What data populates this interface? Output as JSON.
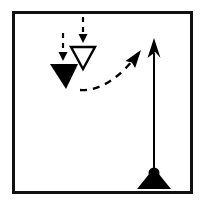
{
  "figure": {
    "title": "Force and trajectory diagram",
    "background_color": "#ffffff",
    "ink_color": "#000000"
  },
  "frame": {
    "name": "outer-border",
    "x": 12,
    "y": 11,
    "width": 181,
    "height": 183,
    "stroke_width": 3,
    "color": "#111111"
  },
  "elements": {
    "base_triangle": {
      "label": "support-base",
      "apex_x": 154,
      "apex_y": 168,
      "left_x": 137,
      "right_x": 171,
      "bottom_y": 189,
      "fill": "#000000"
    },
    "pivot_dot": {
      "label": "pivot",
      "cx": 154,
      "cy": 173,
      "r": 5.5,
      "fill": "#000000"
    },
    "vertical_arrow": {
      "label": "upward-reaction-arrow",
      "x1": 154,
      "y1": 170,
      "x2": 154,
      "y2": 38,
      "stroke_width": 2,
      "head_width": 13,
      "head_length": 20,
      "color": "#000000",
      "style": "solid"
    },
    "curved_arrow": {
      "label": "dashed-trajectory-arrow",
      "start_x": 80,
      "start_y": 90,
      "control_x": 110,
      "control_y": 92,
      "end_x": 141,
      "end_y": 50,
      "stroke_width": 2.4,
      "dash": "7 6",
      "color": "#000000",
      "style": "dashed"
    },
    "hollow_triangle": {
      "label": "open-down-triangle",
      "cx": 83,
      "top_y": 47,
      "bottom_y": 69,
      "half_width": 12,
      "fill": "none",
      "stroke": "#000000",
      "stroke_width": 2.4
    },
    "filled_triangle": {
      "label": "solid-down-triangle",
      "cx": 64,
      "top_y": 64,
      "bottom_y": 89,
      "half_width": 14,
      "fill": "#000000"
    },
    "dashed_arrow_center": {
      "label": "dashed-down-arrow-center",
      "x": 83,
      "y1": 17,
      "y2": 43,
      "stroke_width": 2.2,
      "dash": "5 5",
      "head_width": 9,
      "head_length": 9,
      "color": "#000000"
    },
    "dashed_arrow_left": {
      "label": "dashed-down-arrow-left",
      "x": 63,
      "y1": 33,
      "y2": 61,
      "stroke_width": 2.2,
      "dash": "5 5",
      "head_width": 9,
      "head_length": 9,
      "color": "#000000"
    }
  }
}
